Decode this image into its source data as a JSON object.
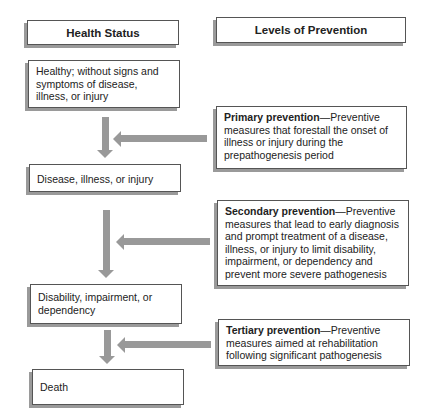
{
  "headers": {
    "left": "Health Status",
    "right": "Levels of Prevention"
  },
  "health_status": [
    "Healthy; without signs and symptoms of disease, illness, or injury",
    "Disease, illness, or injury",
    "Disability, impairment, or dependency",
    "Death"
  ],
  "prevention": [
    {
      "title": "Primary prevention",
      "dash": "—",
      "text": "Preventive measures that forestall the onset of illness or injury during the prepathogenesis period"
    },
    {
      "title": "Secondary prevention",
      "dash": "—",
      "text": "Preventive measures that lead to early diagnosis and prompt treatment of a disease, illness, or injury to limit disability, impairment, or dependency and prevent more severe pathogenesis"
    },
    {
      "title": "Tertiary prevention",
      "dash": "—",
      "text": "Preventive measures aimed at rehabilitation following significant pathogenesis"
    }
  ],
  "colors": {
    "arrow": "#999999",
    "shadow": "#9a9a9a",
    "border": "#555555"
  }
}
